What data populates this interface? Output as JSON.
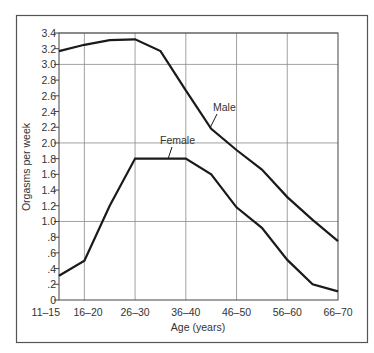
{
  "chart_data": {
    "type": "line",
    "title": "",
    "xlabel": "Age (years)",
    "ylabel": "Orgasms per week",
    "ylim": [
      0,
      3.4
    ],
    "grid": true,
    "legend_position": "inline labels",
    "x": [
      "11-15",
      "16-20",
      "21-25",
      "26-30",
      "31-35",
      "36-40",
      "41-45",
      "46-50",
      "51-55",
      "56-60",
      "61-65",
      "66-70"
    ],
    "x_tick_labels": [
      "11–15",
      "16–20",
      "26–30",
      "36–40",
      "46–50",
      "56–60",
      "66–70"
    ],
    "y_tick_labels": [
      "0",
      ".2",
      ".4",
      ".6",
      ".8",
      "1.0",
      "1.2",
      "1.4",
      "1.6",
      "1.8",
      "2.0",
      "2.2",
      "2.4",
      "2.6",
      "2.8",
      "3.0",
      "3.2",
      "3.4"
    ],
    "series": [
      {
        "name": "Male",
        "values": [
          3.17,
          3.25,
          3.31,
          3.32,
          3.17,
          2.67,
          2.18,
          1.91,
          1.66,
          1.31,
          1.02,
          0.75
        ]
      },
      {
        "name": "Female",
        "values": [
          0.31,
          0.5,
          1.2,
          1.8,
          1.8,
          1.8,
          1.6,
          1.18,
          0.92,
          0.51,
          0.2,
          0.11
        ]
      }
    ]
  },
  "colors": {
    "line": "#1a1a1a",
    "grid": "#8a8a8a",
    "frame": "#555555",
    "text": "#333333"
  }
}
